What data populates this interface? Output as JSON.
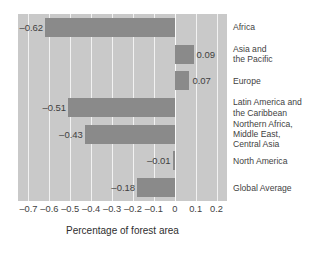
{
  "chart_data": {
    "type": "bar",
    "orientation": "horizontal",
    "title": "",
    "xlabel": "Percentage of forest area",
    "ylabel": "",
    "xlim": [
      -0.75,
      0.25
    ],
    "xticks": [
      "–0.7",
      "–0.6",
      "–0.5",
      "–0.4",
      "–0.3",
      "–0.2",
      "–0.1",
      "0",
      "0.1",
      "0.2"
    ],
    "xtick_values": [
      -0.7,
      -0.6,
      -0.5,
      -0.4,
      -0.3,
      -0.2,
      -0.1,
      0,
      0.1,
      0.2
    ],
    "grid": "vertical",
    "legend": "none",
    "categories": [
      "Africa",
      "Asia and\nthe Pacific",
      "Europe",
      "Latin America and\nthe Caribbean",
      "Northern Africa,\nMiddle East,\nCentral Asia",
      "North America",
      "Global Average"
    ],
    "values": [
      -0.62,
      0.09,
      0.07,
      -0.51,
      -0.43,
      -0.01,
      -0.18
    ],
    "value_labels": [
      "–0.62",
      "0.09",
      "0.07",
      "–0.51",
      "–0.43",
      "–0.01",
      "–0.18"
    ],
    "bar_color": "#8a8a8a",
    "plot_background": "#c9c9c9",
    "gridline_color": "#f2f2f2"
  }
}
